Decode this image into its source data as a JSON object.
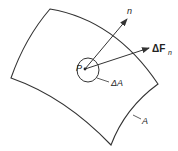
{
  "diagram": {
    "type": "stress-vector-surface",
    "labels": {
      "normal": "n",
      "force": "ΔF",
      "force_sub": "n",
      "point": "P",
      "small_area": "ΔA",
      "area": "A"
    },
    "colors": {
      "stroke": "#333333",
      "background": "#ffffff"
    }
  }
}
